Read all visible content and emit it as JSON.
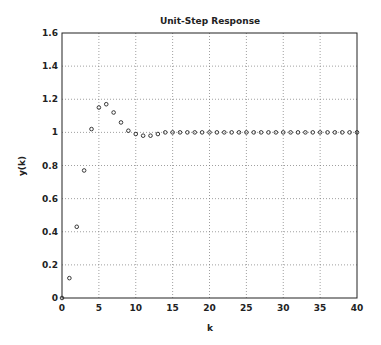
{
  "chart_data": {
    "type": "scatter",
    "title": "Unit-Step Response",
    "xlabel": "k",
    "ylabel": "y(k)",
    "xlim": [
      0,
      40
    ],
    "ylim": [
      0,
      1.6
    ],
    "xticks": [
      0,
      5,
      10,
      15,
      20,
      25,
      30,
      35,
      40
    ],
    "yticks": [
      0,
      0.2,
      0.4,
      0.6,
      0.8,
      1,
      1.2,
      1.4,
      1.6
    ],
    "ytick_labels": [
      "0",
      "0.2",
      "0.4",
      "0.6",
      "0.8",
      "1",
      "1.2",
      "1.4",
      "1.6"
    ],
    "grid": true,
    "marker": "circle",
    "series": [
      {
        "name": "y(k)",
        "x": [
          0,
          1,
          2,
          3,
          4,
          5,
          6,
          7,
          8,
          9,
          10,
          11,
          12,
          13,
          14,
          15,
          16,
          17,
          18,
          19,
          20,
          21,
          22,
          23,
          24,
          25,
          26,
          27,
          28,
          29,
          30,
          31,
          32,
          33,
          34,
          35,
          36,
          37,
          38,
          39,
          40
        ],
        "values": [
          0,
          0.12,
          0.43,
          0.77,
          1.02,
          1.15,
          1.17,
          1.12,
          1.06,
          1.01,
          0.99,
          0.98,
          0.98,
          0.99,
          1.0,
          1.0,
          1.0,
          1.0,
          1.0,
          1.0,
          1.0,
          1.0,
          1.0,
          1.0,
          1.0,
          1.0,
          1.0,
          1.0,
          1.0,
          1.0,
          1.0,
          1.0,
          1.0,
          1.0,
          1.0,
          1.0,
          1.0,
          1.0,
          1.0,
          1.0,
          1.0
        ]
      }
    ]
  }
}
